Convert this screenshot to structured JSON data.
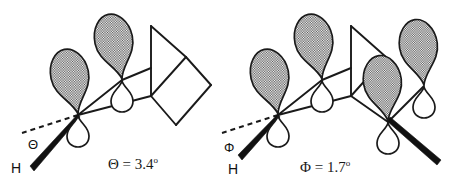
{
  "figure": {
    "background_color": "#ffffff",
    "line_color": "#1a1a1a",
    "lobe_fill_color": "#808080",
    "lobe_stroke_color": "#1a1a1a"
  },
  "panels": [
    {
      "id": "left",
      "caption": "Θ = 3.4",
      "caption_degree": "o",
      "angle_symbol": "Θ",
      "angle_value": "3.4",
      "angle_unit": "degrees",
      "hydrogen_label": "H",
      "orbital_count": 2,
      "skeleton": "bicyclic cage"
    },
    {
      "id": "right",
      "caption": "Φ = 1.7",
      "caption_degree": "o",
      "angle_symbol": "Φ",
      "angle_value": "1.7",
      "angle_unit": "degrees",
      "hydrogen_label": "H",
      "orbital_count": 4,
      "skeleton": "bicyclic cage"
    }
  ],
  "icons": {
    "p_orbital": "p-orbital-lobe",
    "dashed_reference": "dashed-reference-axis",
    "bold_bond": "bold-wedge-bond"
  }
}
